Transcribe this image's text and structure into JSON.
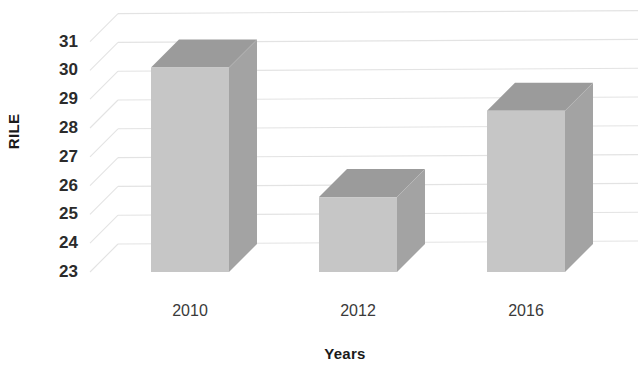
{
  "chart_data": {
    "type": "bar",
    "title": "",
    "subtitle": "",
    "xlabel": "Years",
    "ylabel": "RILE",
    "categories": [
      "2010",
      "2012",
      "2016"
    ],
    "values": [
      30.1,
      25.6,
      28.6
    ],
    "series": [
      {
        "name": "RILE",
        "values": [
          30.1,
          25.6,
          28.6
        ]
      }
    ],
    "ylim": [
      23,
      31
    ],
    "ytick_labels": [
      "31",
      "30",
      "29",
      "28",
      "27",
      "26",
      "25",
      "24",
      "23"
    ],
    "ytick_values": [
      31,
      30,
      29,
      28,
      27,
      26,
      25,
      24,
      23
    ],
    "xtick_labels": [
      "2010",
      "2012",
      "2016"
    ],
    "grid": true,
    "grid_axis": "y",
    "legend": false,
    "legend_position": "none",
    "three_d": true,
    "style": {
      "bar_front_color": "#c6c6c6",
      "bar_side_color": "#a3a3a3",
      "bar_top_color": "#9b9b9b",
      "grid_color": "#e3e3e3",
      "wall_color": "#f2f2f2",
      "background": "#ffffff",
      "text_color": "#2b2b2b"
    }
  }
}
